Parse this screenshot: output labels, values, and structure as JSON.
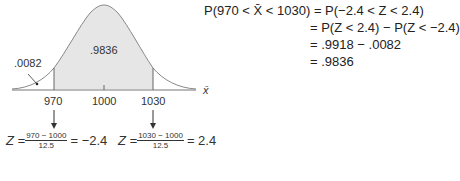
{
  "diagram": {
    "curve_fill": "#e6e6e6",
    "center_area_label": ".9836",
    "tail_area_label": ".0082",
    "axis_label": "x̄",
    "ticks": [
      "970",
      "1000",
      "1030"
    ]
  },
  "z_left": {
    "prefix": "Z =",
    "numerator": "970 − 1000",
    "denominator": "12.5",
    "result": "= −2.4"
  },
  "z_right": {
    "prefix": "Z =",
    "numerator": "1030 − 1000",
    "denominator": "12.5",
    "result": "= 2.4"
  },
  "equations": {
    "line1_lhs": "P(970 < X̄ < 1030)",
    "line1_rhs": "= P(−2.4 < Z < 2.4)",
    "line2": "= P(Z < 2.4) − P(Z < −2.4)",
    "line3": "= .9918 − .0082",
    "line4": "= .9836"
  }
}
